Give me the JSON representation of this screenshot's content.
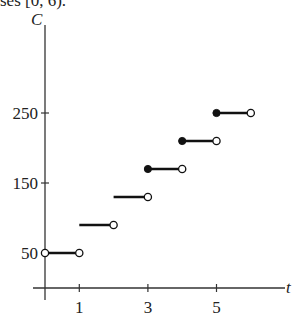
{
  "header": {
    "cut_text": "ses [0, 6)."
  },
  "chart_data": {
    "type": "line",
    "subtype": "step",
    "title": "",
    "xlabel": "t",
    "ylabel": "C",
    "x_ticks": [
      "1",
      "3",
      "5"
    ],
    "y_ticks": [
      "50",
      "150",
      "250"
    ],
    "xlim": [
      0,
      7
    ],
    "ylim": [
      0,
      330
    ],
    "grid": false,
    "segments": [
      {
        "x_start": 0,
        "x_end": 1,
        "y": 50,
        "left": "open",
        "right": "open"
      },
      {
        "x_start": 1,
        "x_end": 2,
        "y": 90,
        "left": "none",
        "right": "open"
      },
      {
        "x_start": 2,
        "x_end": 3,
        "y": 130,
        "left": "none",
        "right": "open"
      },
      {
        "x_start": 3,
        "x_end": 4,
        "y": 170,
        "left": "closed",
        "right": "open"
      },
      {
        "x_start": 4,
        "x_end": 5,
        "y": 210,
        "left": "closed",
        "right": "open"
      },
      {
        "x_start": 5,
        "x_end": 6,
        "y": 250,
        "left": "closed",
        "right": "open"
      }
    ]
  }
}
